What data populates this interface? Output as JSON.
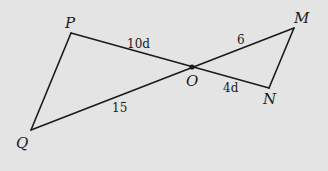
{
  "diagram": {
    "background": "#e4e4e4",
    "stroke_color": "#1a1a1a",
    "points": {
      "P": {
        "label": "P",
        "x": 71,
        "y": 33
      },
      "Q": {
        "label": "Q",
        "x": 31,
        "y": 130
      },
      "M": {
        "label": "M",
        "x": 294,
        "y": 28
      },
      "N": {
        "label": "N",
        "x": 269,
        "y": 88
      },
      "O": {
        "label": "O",
        "x": 192,
        "y": 67
      }
    },
    "segments": [
      {
        "from": "P",
        "to": "Q"
      },
      {
        "from": "P",
        "to": "N"
      },
      {
        "from": "Q",
        "to": "M"
      },
      {
        "from": "M",
        "to": "N"
      }
    ],
    "length_labels": {
      "PO": "10d",
      "OM": "6",
      "ON": "4d",
      "QO": "15"
    }
  }
}
